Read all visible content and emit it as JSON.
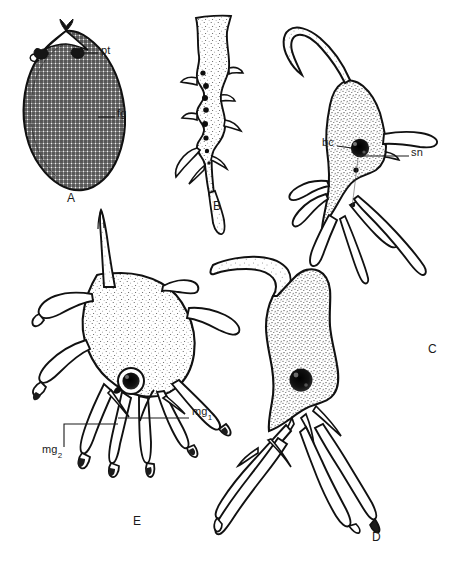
{
  "figure": {
    "kind": "scientific-line-drawing-plate",
    "background_color": "#ffffff",
    "ink_color": "#1a1a1a",
    "width": 456,
    "height": 572
  },
  "panels": [
    {
      "id": "A",
      "letter": "A",
      "letter_x": 67,
      "letter_y": 199,
      "type": "cyst",
      "texture": "cross-hatch-grid",
      "fill_color": "#9a9a9a",
      "outline_color": "#1a1a1a",
      "description": "Pear / tear-drop shaped cyst with dense cross-hatched wall, pointed apex bearing two dark polar structures"
    },
    {
      "id": "B",
      "letter": "B",
      "letter_x": 213,
      "letter_y": 207,
      "type": "elongate-cell",
      "texture": "stipple",
      "fill_color": "#ffffff",
      "outline_color": "#1a1a1a",
      "description": "Narrow elongate branched cell with a vertical chain of dark granules and a long tapering tail"
    },
    {
      "id": "C",
      "letter": "C",
      "letter_x": 428,
      "letter_y": 350,
      "type": "branched-cell",
      "texture": "stipple",
      "fill_color": "#ffffff",
      "outline_color": "#1a1a1a",
      "description": "Branched cell with a long recurved anterior process, a dark nucleus and several blunt posterior pseudopodia"
    },
    {
      "id": "D",
      "letter": "D",
      "letter_x": 372,
      "letter_y": 538,
      "type": "branched-cell",
      "texture": "stipple",
      "fill_color": "#ffffff",
      "outline_color": "#1a1a1a",
      "description": "Large stippled body with a hooked anterior lobe, central dark nucleus and several very long crossing filamentous processes"
    },
    {
      "id": "E",
      "letter": "E",
      "letter_x": 133,
      "letter_y": 522,
      "type": "branched-cell",
      "texture": "stipple",
      "fill_color": "#ffffff",
      "outline_color": "#1a1a1a",
      "description": "Broad multi-branched cell with many finger-like pseudopodia bearing dark tips and a dark central nucleus"
    }
  ],
  "annotations": [
    {
      "key": "pt",
      "label": "pt",
      "panel": "A",
      "label_x": 101,
      "label_y": 50,
      "leader": {
        "x1": 98,
        "y1": 53,
        "x2": 80,
        "y2": 53
      },
      "points_to": "polar structure at cyst apex"
    },
    {
      "key": "fg",
      "label": "fg",
      "panel": "A",
      "label_x": 117,
      "label_y": 113,
      "leader": {
        "x1": 115,
        "y1": 117,
        "x2": 98,
        "y2": 117
      },
      "points_to": "cross-hatched cyst wall"
    },
    {
      "key": "bc",
      "label": "bc",
      "panel": "C",
      "label_x": 322,
      "label_y": 142,
      "leader": {
        "x1": 336,
        "y1": 146,
        "x2": 357,
        "y2": 148
      },
      "points_to": "dark nucleus / body centre"
    },
    {
      "key": "sn",
      "label": "sn",
      "panel": "C",
      "label_x": 411,
      "label_y": 152,
      "leader": {
        "x1": 409,
        "y1": 156,
        "x2": 362,
        "y2": 156
      },
      "points_to": "stained nuclear region right of nucleus"
    },
    {
      "key": "mg1",
      "label": "mg",
      "sub": "1",
      "panel": "E",
      "label_x": 192,
      "label_y": 412,
      "leader": {
        "x1": 190,
        "y1": 418,
        "x2": 118,
        "y2": 418
      },
      "points_to": "marginal granule group one"
    },
    {
      "key": "mg2",
      "label": "mg",
      "sub": "2",
      "panel": "E",
      "label_x": 42,
      "label_y": 450,
      "leader": {
        "x1": 64,
        "y1": 447,
        "x2": 64,
        "y2": 424
      },
      "points_to": "marginal granule group two"
    }
  ]
}
